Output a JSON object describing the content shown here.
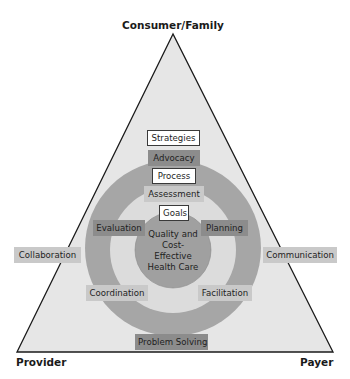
{
  "diagram": {
    "vertices": {
      "top": "Consumer/Family",
      "left": "Provider",
      "right": "Payer"
    },
    "headers": {
      "strategies": "Strategies",
      "process": "Process",
      "goals": "Goals"
    },
    "strategies": {
      "top": "Advocacy",
      "left": "Collaboration",
      "right": "Communication",
      "bottom": "Problem Solving"
    },
    "process": {
      "top": "Assessment",
      "upper_left": "Evaluation",
      "upper_right": "Planning",
      "lower_left": "Coordination",
      "lower_right": "Facilitation"
    },
    "goal": {
      "line1": "Quality and",
      "line2": "Cost-",
      "line3": "Effective",
      "line4": "Health Care"
    },
    "colors": {
      "triangle_fill": "#e6e6e6",
      "outer_ring": "#a6a6a6",
      "inner_circle": "#dcdcdc",
      "center_circle": "#a0a0a0",
      "outline": "#1a1a1a"
    }
  }
}
